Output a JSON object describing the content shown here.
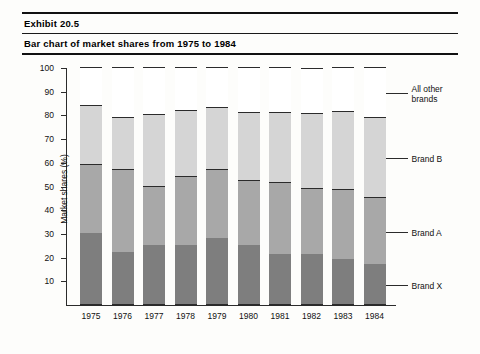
{
  "header": {
    "exhibit_label": "Exhibit 20.5",
    "title": "Bar chart of market shares from 1975 to 1984"
  },
  "chart_data": {
    "type": "bar",
    "subtype": "stacked-100",
    "title": "Bar chart of market shares from 1975 to 1984",
    "xlabel": "",
    "ylabel": "Market shares (%)",
    "ylim": [
      0,
      100
    ],
    "yticks": [
      10,
      20,
      30,
      40,
      50,
      60,
      70,
      80,
      90,
      100
    ],
    "grid": false,
    "legend_position": "right",
    "categories": [
      "1975",
      "1976",
      "1977",
      "1978",
      "1979",
      "1980",
      "1981",
      "1982",
      "1983",
      "1984"
    ],
    "series": [
      {
        "name": "Brand X",
        "color": "#7e7e7e",
        "values": [
          30,
          22,
          25,
          25,
          28,
          25,
          21,
          21,
          19,
          17
        ]
      },
      {
        "name": "Brand A",
        "color": "#a8a8a8",
        "values": [
          29,
          35,
          25,
          29,
          29,
          27.5,
          30.5,
          28,
          29.5,
          28
        ]
      },
      {
        "name": "Brand B",
        "color": "#d5d5d5",
        "values": [
          25,
          22,
          30,
          28,
          26,
          28.5,
          29.5,
          31.5,
          33,
          34
        ]
      },
      {
        "name": "All other brands",
        "color": "#ffffff",
        "values": [
          16,
          21,
          20,
          18,
          17,
          19,
          19,
          19,
          18.5,
          21
        ]
      }
    ],
    "cumulative_tops": {
      "brand_x": [
        30,
        22,
        25,
        25,
        28,
        25,
        21,
        21,
        19,
        17
      ],
      "brand_a": [
        59,
        57,
        50,
        54,
        57,
        52.5,
        51.5,
        49,
        48.5,
        45
      ],
      "brand_b": [
        84,
        79,
        80,
        82,
        83,
        81,
        81,
        81,
        81.5,
        79
      ],
      "all_other": [
        100,
        100,
        100,
        100,
        100,
        100,
        100,
        100,
        100,
        100
      ]
    },
    "legend": [
      {
        "label": "All other\nbrands",
        "color": "#ffffff"
      },
      {
        "label": "Brand B",
        "color": "#d5d5d5"
      },
      {
        "label": "Brand A",
        "color": "#a8a8a8"
      },
      {
        "label": "Brand X",
        "color": "#7e7e7e"
      }
    ]
  }
}
